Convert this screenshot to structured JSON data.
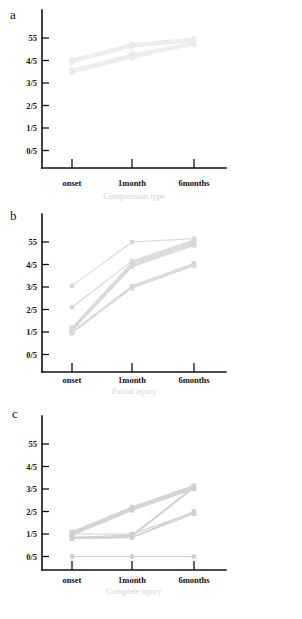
{
  "figure": {
    "panels": [
      {
        "letter": "a",
        "caption": "Compression type",
        "watermark": ""
      },
      {
        "letter": "b",
        "caption": "Partial injury",
        "watermark": ""
      },
      {
        "letter": "c",
        "caption": "Complete injury",
        "watermark": ""
      }
    ],
    "y_ticks": [
      "55",
      "4/5",
      "3/5",
      "2/5",
      "1/5",
      "0/5"
    ],
    "x_ticks": [
      "onset",
      "1month",
      "6months"
    ]
  },
  "chart_data": [
    {
      "type": "line",
      "title": "a",
      "xlabel": "Compression type",
      "ylabel": "",
      "x": [
        "onset",
        "1month",
        "6months"
      ],
      "categories": [
        "onset",
        "1month",
        "6months"
      ],
      "ytick_labels": [
        "0/5",
        "1/5",
        "2/5",
        "3/5",
        "4/5",
        "55"
      ],
      "ylim": [
        0,
        5
      ],
      "grid": false,
      "legend": "none",
      "line_color": "#ececec",
      "series": [
        {
          "name": "case a1",
          "values": [
            4.05,
            4.75,
            5.0
          ]
        },
        {
          "name": "case a2",
          "values": [
            4.0,
            4.7,
            4.95
          ]
        },
        {
          "name": "case a3",
          "values": [
            4.0,
            4.65,
            4.9
          ]
        },
        {
          "name": "case a4",
          "values": [
            3.95,
            4.6,
            4.9
          ]
        },
        {
          "name": "case a5",
          "values": [
            3.9,
            4.6,
            4.85
          ]
        },
        {
          "name": "case a6",
          "values": [
            3.6,
            4.3,
            4.8
          ]
        },
        {
          "name": "case a7",
          "values": [
            3.55,
            4.25,
            4.8
          ]
        },
        {
          "name": "case a8",
          "values": [
            3.5,
            4.2,
            4.75
          ]
        },
        {
          "name": "case a9",
          "values": [
            3.5,
            4.15,
            4.75
          ]
        },
        {
          "name": "case a10",
          "values": [
            3.45,
            4.1,
            4.7
          ]
        }
      ]
    },
    {
      "type": "line",
      "title": "b",
      "xlabel": "Partial injury",
      "ylabel": "",
      "x": [
        "onset",
        "1month",
        "6months"
      ],
      "categories": [
        "onset",
        "1month",
        "6months"
      ],
      "ytick_labels": [
        "0/5",
        "1/5",
        "2/5",
        "3/5",
        "4/5",
        "55"
      ],
      "ylim": [
        0,
        5
      ],
      "grid": false,
      "legend": "none",
      "line_color": "#d8d8d8",
      "series": [
        {
          "name": "case b1",
          "values": [
            3.05,
            5.0,
            5.15
          ]
        },
        {
          "name": "case b2",
          "values": [
            2.1,
            4.15,
            5.1
          ]
        },
        {
          "name": "case b3",
          "values": [
            1.2,
            4.1,
            5.05
          ]
        },
        {
          "name": "case b4",
          "values": [
            1.15,
            4.05,
            5.0
          ]
        },
        {
          "name": "case b5",
          "values": [
            1.1,
            4.0,
            4.95
          ]
        },
        {
          "name": "case b6",
          "values": [
            1.1,
            3.95,
            4.9
          ]
        },
        {
          "name": "case b7",
          "values": [
            1.05,
            3.9,
            4.85
          ]
        },
        {
          "name": "case b8",
          "values": [
            1.0,
            3.05,
            4.05
          ]
        },
        {
          "name": "case b9",
          "values": [
            1.0,
            3.0,
            4.0
          ]
        },
        {
          "name": "case b10",
          "values": [
            0.95,
            2.95,
            3.95
          ]
        }
      ]
    },
    {
      "type": "line",
      "title": "c",
      "xlabel": "Complete injury",
      "ylabel": "",
      "x": [
        "onset",
        "1month",
        "6months"
      ],
      "categories": [
        "onset",
        "1month",
        "6months"
      ],
      "ytick_labels": [
        "0/5",
        "1/5",
        "2/5",
        "3/5",
        "4/5",
        "55"
      ],
      "ylim": [
        0,
        5
      ],
      "grid": false,
      "legend": "none",
      "line_color": "#cfcfcf",
      "series": [
        {
          "name": "case c1",
          "values": [
            1.1,
            2.2,
            3.15
          ]
        },
        {
          "name": "case c2",
          "values": [
            1.05,
            2.15,
            3.1
          ]
        },
        {
          "name": "case c3",
          "values": [
            1.0,
            2.1,
            3.05
          ]
        },
        {
          "name": "case c4",
          "values": [
            0.95,
            2.05,
            3.0
          ]
        },
        {
          "name": "case c5",
          "values": [
            0.85,
            0.95,
            3.1
          ]
        },
        {
          "name": "case c6",
          "values": [
            0.8,
            0.9,
            3.05
          ]
        },
        {
          "name": "case c7",
          "values": [
            0.8,
            0.85,
            2.0
          ]
        },
        {
          "name": "case c8",
          "values": [
            1.0,
            1.0,
            1.95
          ]
        },
        {
          "name": "case c9",
          "values": [
            0.8,
            0.85,
            1.9
          ]
        },
        {
          "name": "case c10",
          "values": [
            0.0,
            0.0,
            0.0
          ]
        }
      ]
    }
  ]
}
